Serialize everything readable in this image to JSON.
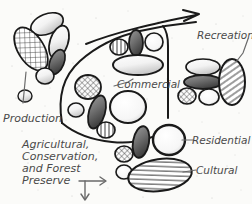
{
  "diagram": {
    "medium": "hand-drawn pencil and ink sketch on paper",
    "background_color": "#fbfbf9",
    "ink_color": "#1a1a1a",
    "pencil_color": "#6a6a6a",
    "labels": {
      "production": "Production",
      "commercial": "Commercial",
      "recreation": "Recreation",
      "residential": "Residential",
      "cultural": "Cultural",
      "agricultural_line1": "Agricultural,",
      "agricultural_line2": "Conservation,",
      "agricultural_line3": "and Forest",
      "agricultural_line4": "Preserve"
    },
    "zones": [
      {
        "name": "Production",
        "fill": "cross-hatch",
        "position": "left"
      },
      {
        "name": "Commercial",
        "fill": "mixed",
        "position": "center"
      },
      {
        "name": "Recreation",
        "fill": "diagonal-hatch",
        "position": "right"
      },
      {
        "name": "Residential",
        "fill": "outline-ring",
        "position": "lower-right"
      },
      {
        "name": "Cultural",
        "fill": "horizontal-hatch",
        "position": "bottom"
      },
      {
        "name": "Agricultural, Conservation, and Forest Preserve",
        "fill": "none",
        "position": "lower-left"
      }
    ],
    "arrows": [
      {
        "name": "top-growth-arrow",
        "direction": "right",
        "color": "#1a1a1a"
      },
      {
        "name": "expansion-arrow-right",
        "direction": "right",
        "color": "#6a6a6a"
      },
      {
        "name": "expansion-arrow-down",
        "direction": "down",
        "color": "#6a6a6a"
      }
    ]
  }
}
